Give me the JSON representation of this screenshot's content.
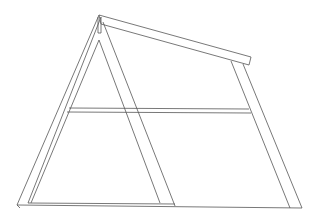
{
  "figure": {
    "title": "",
    "stroke_color": "#555555",
    "background": "#ffffff",
    "parts": [
      {
        "name": "left-leg"
      },
      {
        "name": "inner-triangle"
      },
      {
        "name": "top-rail"
      },
      {
        "name": "right-post"
      },
      {
        "name": "cross-bar"
      },
      {
        "name": "base-rail"
      },
      {
        "name": "apex-post"
      }
    ]
  }
}
